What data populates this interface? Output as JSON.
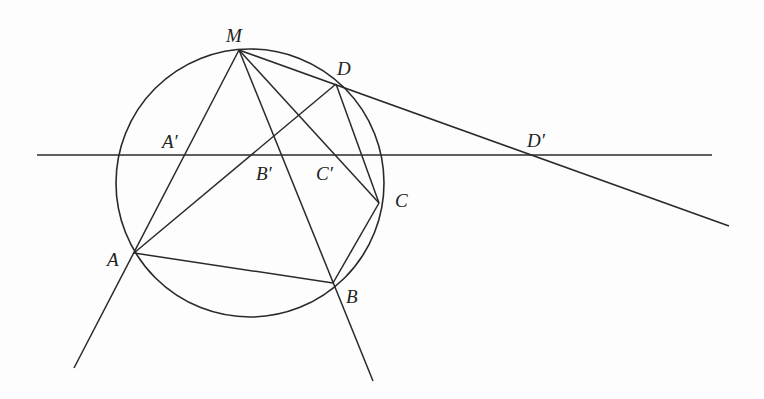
{
  "diagram": {
    "type": "geometry-figure",
    "stroke_color": "#2a2a2a",
    "circle": {
      "cx": 250,
      "cy": 183,
      "r": 134
    },
    "points": [
      {
        "id": "M",
        "label": "M",
        "x": 239,
        "y": 50,
        "lx": 226,
        "ly": 26
      },
      {
        "id": "D",
        "label": "D",
        "x": 336,
        "y": 84,
        "lx": 337,
        "ly": 59
      },
      {
        "id": "C",
        "label": "C",
        "x": 379,
        "y": 203,
        "lx": 395,
        "ly": 191
      },
      {
        "id": "B",
        "label": "B",
        "x": 333,
        "y": 283,
        "lx": 346,
        "ly": 287
      },
      {
        "id": "A",
        "label": "A",
        "x": 134,
        "y": 253,
        "lx": 107,
        "ly": 250
      },
      {
        "id": "A'",
        "label": "A′",
        "x": 185,
        "y": 155,
        "lx": 162,
        "ly": 132
      },
      {
        "id": "B'",
        "label": "B′",
        "x": 254,
        "y": 155,
        "lx": 256,
        "ly": 164
      },
      {
        "id": "C'",
        "label": "C′",
        "x": 338,
        "y": 155,
        "lx": 316,
        "ly": 164
      },
      {
        "id": "D'",
        "label": "D′",
        "x": 533,
        "y": 155,
        "lx": 527,
        "ly": 131
      }
    ],
    "segments": [
      {
        "name": "horizontal-line",
        "x1": 37,
        "y1": 155,
        "x2": 712,
        "y2": 155
      },
      {
        "name": "line-M-A-extended",
        "x1": 239,
        "y1": 50,
        "x2": 74,
        "y2": 368
      },
      {
        "name": "line-M-B-extended",
        "x1": 239,
        "y1": 50,
        "x2": 373,
        "y2": 381
      },
      {
        "name": "line-M-C",
        "x1": 239,
        "y1": 50,
        "x2": 379,
        "y2": 203
      },
      {
        "name": "line-M-D-extended",
        "x1": 239,
        "y1": 50,
        "x2": 729,
        "y2": 226
      },
      {
        "name": "segment-A-D",
        "x1": 134,
        "y1": 253,
        "x2": 336,
        "y2": 84
      },
      {
        "name": "segment-A-B",
        "x1": 134,
        "y1": 253,
        "x2": 333,
        "y2": 283
      },
      {
        "name": "segment-B-C",
        "x1": 333,
        "y1": 283,
        "x2": 379,
        "y2": 203
      },
      {
        "name": "segment-C-D",
        "x1": 379,
        "y1": 203,
        "x2": 336,
        "y2": 84
      }
    ]
  }
}
